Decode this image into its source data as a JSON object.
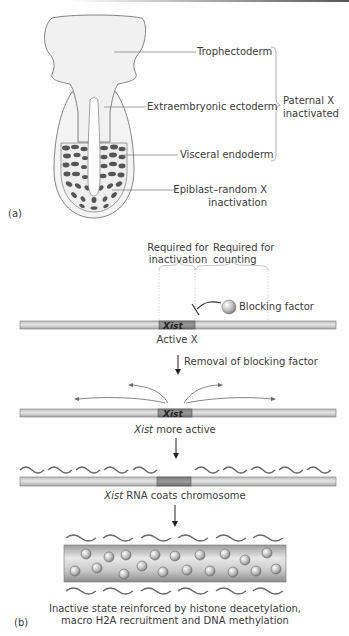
{
  "panel_a": {
    "label": "(a)",
    "labels": {
      "trophectoderm": "Trophectoderm",
      "extraembryonic_ectoderm": "Extraembryonic ectoderm",
      "visceral_endoderm": "Visceral endoderm",
      "epiblast_line1": "Epiblast–random X",
      "epiblast_line2": "inactivation"
    },
    "bracket_label_line1": "Paternal X",
    "bracket_label_line2": "inactivated"
  },
  "panel_b": {
    "label": "(b)",
    "region_inactivation_line1": "Required for",
    "region_inactivation_line2": "inactivation",
    "region_counting_line1": "Required for",
    "region_counting_line2": "counting",
    "blocking_factor": "Blocking factor",
    "gene_name": "Xist",
    "step1_caption": "Active X",
    "step1_arrow_label": "Removal of blocking factor",
    "step2_caption_italic": "Xist",
    "step2_caption_rest": " more active",
    "step3_caption_italic": "Xist",
    "step3_caption_rest": " RNA coats chromosome",
    "step4_caption_line1": "Inactive state reinforced by histone deacetylation,",
    "step4_caption_line2": "macro H2A recruitment and DNA methylation"
  },
  "colors": {
    "chromosome_fill": "#d4d4d4",
    "xist_fill": "#8a8a8a",
    "embryo_fill": "#f4f4f4",
    "epiblast_cells": "#555555",
    "line": "#555555"
  }
}
